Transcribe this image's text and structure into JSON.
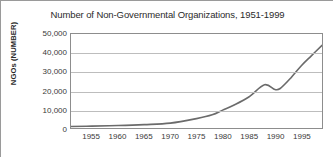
{
  "chart_data": {
    "type": "line",
    "title": "Number of Non-Governmental Organizations, 1951-1999",
    "xlabel": "",
    "ylabel": "NGOs (NUMBER)",
    "xlim": [
      1951,
      1999
    ],
    "ylim": [
      0,
      50000
    ],
    "grid": true,
    "legend": false,
    "line_color": "#6b6b6b",
    "yticks": [
      50000,
      40000,
      30000,
      20000,
      10000,
      0
    ],
    "ytick_labels": [
      "50,000",
      "40,000",
      "30,000",
      "20,000",
      "10,000",
      "0"
    ],
    "xticks": [
      1955,
      1960,
      1965,
      1970,
      1975,
      1980,
      1985,
      1990,
      1995
    ],
    "xtick_labels": [
      "1955",
      "1960",
      "1965",
      "1970",
      "1975",
      "1980",
      "1985",
      "1990",
      "1995"
    ],
    "series": [
      {
        "name": "NGOs",
        "x": [
          1951,
          1955,
          1960,
          1965,
          1970,
          1975,
          1978,
          1980,
          1982,
          1985,
          1988,
          1990,
          1991,
          1993,
          1995,
          1997,
          1999
        ],
        "values": [
          800,
          1000,
          1300,
          1800,
          2600,
          5000,
          7000,
          9500,
          12000,
          16500,
          23000,
          20500,
          21000,
          26500,
          33000,
          38500,
          44000
        ]
      }
    ]
  }
}
